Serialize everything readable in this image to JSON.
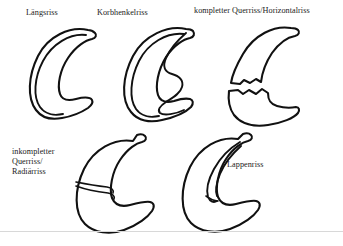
{
  "figure": {
    "background_color": "#ffffff",
    "ink_color": "#111111",
    "width": 343,
    "height": 246
  },
  "labels": {
    "longitudinal": "Längsriss",
    "bucket_handle": "Korbhenkelriss",
    "complete_transverse": "kompletter Querriss/Horizontalriss",
    "incomplete_radial_line1": "inkompletter",
    "incomplete_radial_line2": "Querriss/",
    "incomplete_radial_line3": "Radiärriss",
    "flap": "Lappenriss"
  },
  "diagrams": [
    {
      "id": "longitudinal",
      "label": "Längsriss",
      "description": "C-förmiger Meniskus mit längs verlaufender Rissline parallel zur Außenkontur",
      "tear_type": "longitudinal",
      "position": "top-left"
    },
    {
      "id": "bucket-handle",
      "label": "Korbhenkelriss",
      "description": "Verlagertes Korbhenkel-Fragment mit gewellter Innenkontur",
      "tear_type": "bucket-handle",
      "position": "top-center"
    },
    {
      "id": "complete-transverse",
      "label": "kompletter Querriss/Horizontalriss",
      "description": "Vollständige Durchtrennung in zwei getrennte Fragmente mit gezackten Bruchkanten",
      "tear_type": "complete-transverse",
      "position": "top-right"
    },
    {
      "id": "incomplete-radial",
      "label": "inkompletter Querriss/Radiärriss",
      "description": "Keilförmiger Einriss vom Außenrand, nicht durchgehend",
      "tear_type": "incomplete-radial",
      "position": "bottom-center"
    },
    {
      "id": "flap",
      "label": "Lappenriss",
      "description": "Schmaler zungenförmiger Lappen im oberen Meniskusanteil",
      "tear_type": "flap",
      "position": "bottom-right"
    }
  ]
}
